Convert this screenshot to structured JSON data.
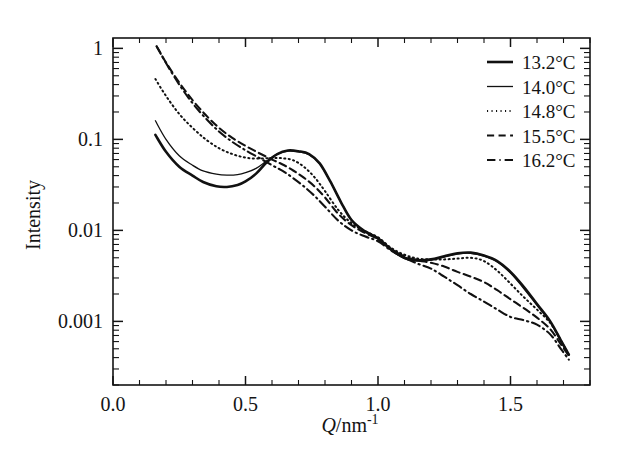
{
  "chart_data": {
    "type": "line",
    "title": "",
    "xlabel": "Q/nm^-1",
    "xlabel_parts": {
      "symbol": "Q",
      "unit": "/nm",
      "exponent": "-1"
    },
    "ylabel": "Intensity",
    "xlim": [
      0.0,
      1.8
    ],
    "ylim": [
      0.0002,
      1.3
    ],
    "yscale": "log",
    "xscale": "linear",
    "grid": false,
    "legend_position": "top-right",
    "xticks": [
      "0.0",
      "0.5",
      "1.0",
      "1.5"
    ],
    "xtick_values": [
      0.0,
      0.5,
      1.0,
      1.5
    ],
    "yticks": [
      "1",
      "0.1",
      "0.01",
      "0.001"
    ],
    "ytick_values": [
      1,
      0.1,
      0.01,
      0.001
    ],
    "line_color": "#111111",
    "series": [
      {
        "name": "13.2°C",
        "style": "solid",
        "width": 2.6,
        "x": [
          0.16,
          0.2,
          0.25,
          0.3,
          0.34,
          0.39,
          0.43,
          0.47,
          0.5,
          0.54,
          0.58,
          0.62,
          0.66,
          0.7,
          0.74,
          0.78,
          0.82,
          0.86,
          0.9,
          0.95,
          1.0,
          1.05,
          1.1,
          1.15,
          1.2,
          1.25,
          1.3,
          1.35,
          1.4,
          1.45,
          1.5,
          1.55,
          1.6,
          1.65,
          1.69,
          1.72
        ],
        "y": [
          0.112,
          0.073,
          0.05,
          0.04,
          0.034,
          0.0305,
          0.03,
          0.0315,
          0.0345,
          0.042,
          0.056,
          0.069,
          0.0755,
          0.074,
          0.069,
          0.0545,
          0.0345,
          0.0205,
          0.013,
          0.0098,
          0.0082,
          0.0062,
          0.005,
          0.0047,
          0.0048,
          0.0052,
          0.0056,
          0.0057,
          0.0053,
          0.0046,
          0.0035,
          0.0024,
          0.00155,
          0.001,
          0.00062,
          0.00043
        ]
      },
      {
        "name": "14.0°C",
        "style": "thin-solid",
        "width": 1.3,
        "x": [
          0.16,
          0.2,
          0.25,
          0.3,
          0.34,
          0.39,
          0.43,
          0.47,
          0.5,
          0.54,
          0.58,
          0.62,
          0.66,
          0.7,
          0.74,
          0.78,
          0.82,
          0.86,
          0.9,
          0.95,
          1.0,
          1.05,
          1.1,
          1.15,
          1.2,
          1.25,
          1.3,
          1.35,
          1.4,
          1.45,
          1.5,
          1.55,
          1.6,
          1.65,
          1.69,
          1.72
        ],
        "y": [
          0.16,
          0.1,
          0.066,
          0.052,
          0.045,
          0.0415,
          0.0405,
          0.041,
          0.043,
          0.048,
          0.058,
          0.069,
          0.0745,
          0.073,
          0.068,
          0.054,
          0.0345,
          0.0205,
          0.013,
          0.0097,
          0.008,
          0.006,
          0.0049,
          0.0046,
          0.0047,
          0.0051,
          0.0055,
          0.0056,
          0.0052,
          0.0045,
          0.0034,
          0.0023,
          0.0015,
          0.00098,
          0.0006,
          0.00043
        ]
      },
      {
        "name": "14.8°C",
        "style": "dotted",
        "width": 2.0,
        "x": [
          0.16,
          0.2,
          0.25,
          0.3,
          0.35,
          0.4,
          0.45,
          0.5,
          0.55,
          0.6,
          0.64,
          0.68,
          0.72,
          0.76,
          0.8,
          0.85,
          0.9,
          0.95,
          1.0,
          1.05,
          1.1,
          1.15,
          1.2,
          1.25,
          1.3,
          1.35,
          1.4,
          1.45,
          1.5,
          1.55,
          1.6,
          1.65,
          1.69,
          1.72
        ],
        "y": [
          0.46,
          0.3,
          0.19,
          0.134,
          0.1,
          0.08,
          0.069,
          0.063,
          0.0615,
          0.0625,
          0.062,
          0.059,
          0.05,
          0.0385,
          0.027,
          0.0168,
          0.012,
          0.0098,
          0.0084,
          0.0064,
          0.0054,
          0.0049,
          0.0048,
          0.0048,
          0.0049,
          0.005,
          0.0046,
          0.0036,
          0.0026,
          0.00185,
          0.00135,
          0.00096,
          0.00062,
          0.00043
        ]
      },
      {
        "name": "15.5°C",
        "style": "dashed",
        "width": 2.1,
        "x": [
          0.165,
          0.2,
          0.25,
          0.3,
          0.35,
          0.4,
          0.45,
          0.5,
          0.55,
          0.6,
          0.64,
          0.68,
          0.72,
          0.76,
          0.8,
          0.85,
          0.9,
          0.95,
          1.0,
          1.05,
          1.1,
          1.15,
          1.2,
          1.25,
          1.3,
          1.35,
          1.4,
          1.45,
          1.5,
          1.55,
          1.6,
          1.65,
          1.69,
          1.72
        ],
        "y": [
          1.05,
          0.7,
          0.42,
          0.27,
          0.185,
          0.134,
          0.104,
          0.085,
          0.071,
          0.06,
          0.053,
          0.0455,
          0.038,
          0.0305,
          0.023,
          0.0152,
          0.0114,
          0.0094,
          0.008,
          0.0062,
          0.0052,
          0.0047,
          0.0044,
          0.004,
          0.0035,
          0.0031,
          0.0027,
          0.0022,
          0.00175,
          0.0014,
          0.0011,
          0.00082,
          0.00056,
          0.00042
        ]
      },
      {
        "name": "16.2°C",
        "style": "dash-dot",
        "width": 2.1,
        "x": [
          0.165,
          0.2,
          0.25,
          0.3,
          0.35,
          0.4,
          0.45,
          0.5,
          0.55,
          0.6,
          0.64,
          0.68,
          0.72,
          0.76,
          0.8,
          0.85,
          0.9,
          0.95,
          1.0,
          1.05,
          1.1,
          1.15,
          1.2,
          1.25,
          1.3,
          1.35,
          1.4,
          1.45,
          1.5,
          1.55,
          1.6,
          1.65,
          1.69,
          1.72
        ],
        "y": [
          1.05,
          0.69,
          0.4,
          0.25,
          0.17,
          0.122,
          0.094,
          0.076,
          0.063,
          0.052,
          0.045,
          0.0375,
          0.0305,
          0.024,
          0.0182,
          0.0128,
          0.01,
          0.0086,
          0.0076,
          0.006,
          0.005,
          0.0043,
          0.0038,
          0.0031,
          0.0025,
          0.002,
          0.00165,
          0.00135,
          0.00112,
          0.00103,
          0.00092,
          0.00072,
          0.0005,
          0.00038
        ]
      }
    ]
  },
  "legend": {
    "entries": [
      {
        "label": "13.2°C",
        "style": "solid"
      },
      {
        "label": "14.0°C",
        "style": "thin-solid"
      },
      {
        "label": "14.8°C",
        "style": "dotted"
      },
      {
        "label": "15.5°C",
        "style": "dashed"
      },
      {
        "label": "16.2°C",
        "style": "dash-dot"
      }
    ]
  }
}
